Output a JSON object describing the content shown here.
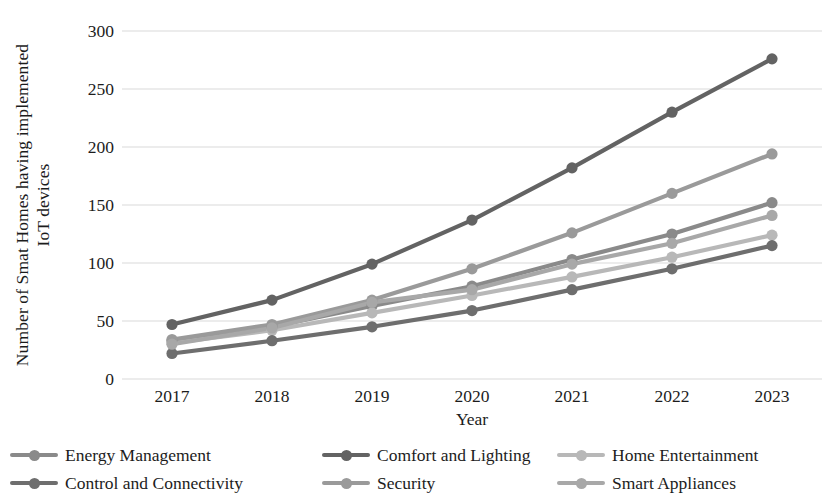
{
  "chart_data": {
    "type": "line",
    "title": "",
    "xlabel": "Year",
    "ylabel": "Number of Smat Homes having implemented IoT devices",
    "ylabel_line1": "Number of Smat Homes having implemented",
    "ylabel_line2": "IoT devices",
    "categories": [
      "2017",
      "2018",
      "2019",
      "2020",
      "2021",
      "2022",
      "2023"
    ],
    "x": [
      2017,
      2018,
      2019,
      2020,
      2021,
      2022,
      2023
    ],
    "ylim": [
      0,
      300
    ],
    "yticks": [
      0,
      50,
      100,
      150,
      200,
      250,
      300
    ],
    "ytick_labels": [
      "0",
      "50",
      "100",
      "150",
      "200",
      "250",
      "300"
    ],
    "grid": true,
    "grid_axis": "y",
    "legend_position": "bottom",
    "legend_columns": 3,
    "series": [
      {
        "name": "Energy Management",
        "color": "#8a8a8a",
        "values": [
          33,
          45,
          63,
          80,
          103,
          125,
          152
        ]
      },
      {
        "name": "Comfort and Lighting",
        "color": "#636363",
        "values": [
          47,
          68,
          99,
          137,
          182,
          230,
          276
        ]
      },
      {
        "name": "Home Entertainment",
        "color": "#b8b8b8",
        "values": [
          31,
          42,
          57,
          72,
          88,
          105,
          124
        ]
      },
      {
        "name": "Control and Connectivity",
        "color": "#6e6e6e",
        "values": [
          22,
          33,
          45,
          59,
          77,
          95,
          115
        ]
      },
      {
        "name": "Security",
        "color": "#9a9a9a",
        "values": [
          34,
          47,
          68,
          95,
          126,
          160,
          194
        ]
      },
      {
        "name": "Smart Appliances",
        "color": "#a8a8a8",
        "values": [
          30,
          44,
          66,
          77,
          99,
          117,
          141
        ]
      }
    ]
  },
  "legend": {
    "items": [
      {
        "label": "Energy Management",
        "color": "#8a8a8a"
      },
      {
        "label": "Control and Connectivity",
        "color": "#6e6e6e"
      },
      {
        "label": "Comfort and Lighting",
        "color": "#636363"
      },
      {
        "label": "Security",
        "color": "#9a9a9a"
      },
      {
        "label": "Home Entertainment",
        "color": "#b8b8b8"
      },
      {
        "label": "Smart Appliances",
        "color": "#a8a8a8"
      }
    ]
  },
  "style": {
    "background": "#ffffff",
    "text_color": "#1c1c1c",
    "gridline_color": "#d9d9d9"
  }
}
